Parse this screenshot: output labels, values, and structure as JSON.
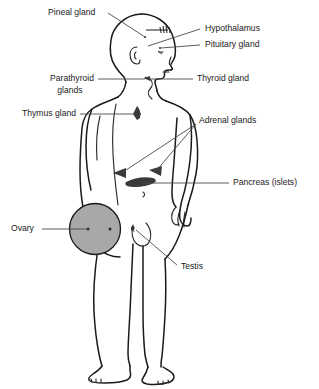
{
  "figure": {
    "background_color": "#ffffff",
    "line_color": "#1a1a1a",
    "leader_color": "#4a4a4a",
    "organ_marker_color": "#3a3a3a",
    "ovary_fill_color": "#a8a8a8",
    "width": 319,
    "height": 389
  },
  "labels": {
    "pineal_gland": "Pineal gland",
    "hypothalamus": "Hypothalamus",
    "pituitary_gland": "Pituitary gland",
    "parathyroid_glands_line1": "Parathyroid",
    "parathyroid_glands_line2": "glands",
    "thyroid_gland": "Thyroid gland",
    "thymus_gland": "Thymus gland",
    "adrenal_glands": "Adrenal glands",
    "pancreas_islets": "Pancreas (islets)",
    "ovary": "Ovary",
    "testis": "Testis"
  },
  "markers": {
    "pineal": "dot-marker",
    "hypothalamus": "hatched-band-marker",
    "pituitary": "small-dot-marker",
    "parathyroid": "neck-dot-marker",
    "thyroid": "neck-gland-marker",
    "thymus": "butterfly-marker",
    "adrenal_left": "triangle-marker",
    "adrenal_right": "triangle-marker",
    "pancreas": "elongated-marker",
    "ovary": "filled-circle-marker",
    "testis": "small-oval-marker"
  }
}
